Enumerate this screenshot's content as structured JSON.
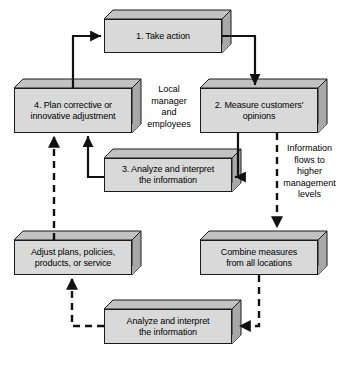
{
  "diagram": {
    "colors": {
      "box_face": "#d9d9d9",
      "box_top": "#c2c2c2",
      "box_side": "#a8a8a8",
      "outline": "#1a1a1a",
      "background": "#ffffff",
      "text": "#000000"
    },
    "boxes": [
      {
        "id": "take-action",
        "label": "1. Take action"
      },
      {
        "id": "plan-corrective",
        "label": "4. Plan corrective or\ninnovative adjustment"
      },
      {
        "id": "measure-customers",
        "label": "2. Measure customers'\nopinions"
      },
      {
        "id": "analyze-interpret-local",
        "label": "3. Analyze and interpret\nthe information"
      },
      {
        "id": "adjust-plans",
        "label": "Adjust plans, policies,\nproducts, or service"
      },
      {
        "id": "combine-measures",
        "label": "Combine measures\nfrom all locations"
      },
      {
        "id": "analyze-interpret-central",
        "label": "Analyze and interpret\nthe information"
      }
    ],
    "annotations": [
      {
        "id": "local-manager",
        "label": "Local\nmanager\nand\nemployees"
      },
      {
        "id": "information-flows",
        "label": "Information\nflows to\nhigher\nmanagement\nlevels"
      }
    ]
  }
}
